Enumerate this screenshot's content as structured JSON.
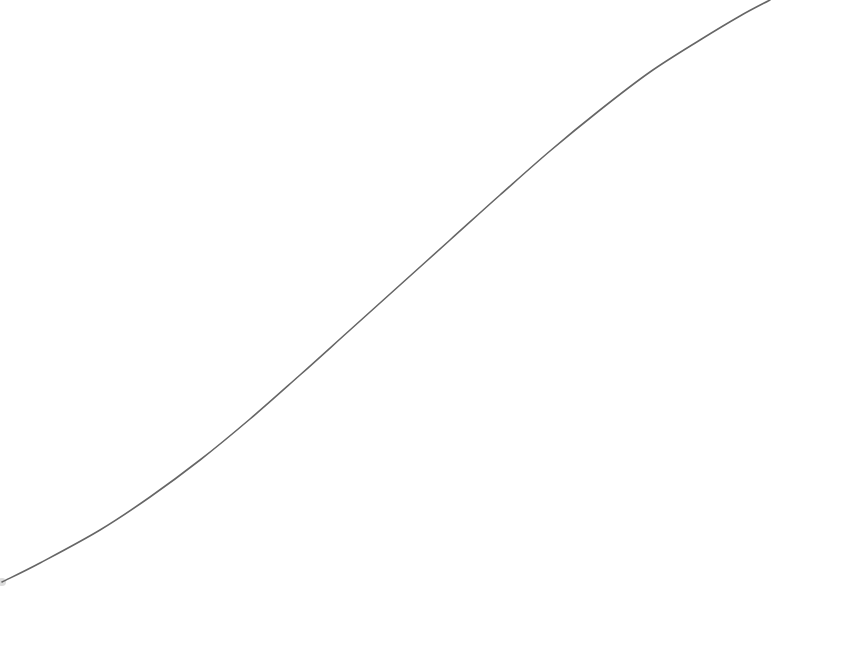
{
  "background_color": "#ffffff",
  "curve": {
    "stroke_color": "#666666",
    "stroke_width": 1.6,
    "start_marker_color": "#dddddd",
    "points": [
      [
        2,
        582
      ],
      [
        40,
        563
      ],
      [
        100,
        530
      ],
      [
        150,
        497
      ],
      [
        200,
        460
      ],
      [
        250,
        419
      ],
      [
        300,
        375
      ],
      [
        350,
        330
      ],
      [
        400,
        285
      ],
      [
        450,
        240
      ],
      [
        500,
        195
      ],
      [
        550,
        151
      ],
      [
        600,
        110
      ],
      [
        650,
        72
      ],
      [
        700,
        40
      ],
      [
        740,
        16
      ],
      [
        770,
        0
      ]
    ]
  }
}
